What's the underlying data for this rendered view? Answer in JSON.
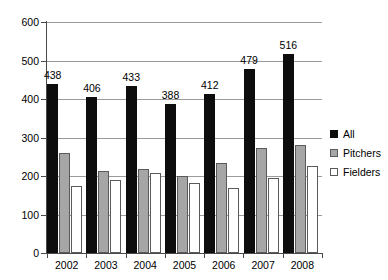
{
  "chart_data": {
    "type": "bar",
    "title": "",
    "subtitle": "",
    "xlabel": "",
    "ylabel": "",
    "categories": [
      "2002",
      "2003",
      "2004",
      "2005",
      "2006",
      "2007",
      "2008"
    ],
    "series": [
      {
        "name": "All",
        "color": "#0d0d0d",
        "values": [
          438,
          406,
          433,
          388,
          412,
          479,
          516
        ],
        "labels": [
          "438",
          "406",
          "433",
          "388",
          "412",
          "479",
          "516"
        ],
        "show_labels": true
      },
      {
        "name": "Pitchers",
        "color": "#a6a6a6",
        "values": [
          261,
          212,
          218,
          199,
          233,
          272,
          281
        ],
        "show_labels": false
      },
      {
        "name": "Fielders",
        "color": "#ffffff",
        "values": [
          173,
          190,
          209,
          183,
          169,
          196,
          225
        ],
        "show_labels": false
      }
    ],
    "ylim": [
      0,
      600
    ],
    "yticks": [
      0,
      100,
      200,
      300,
      400,
      500,
      600
    ],
    "ytick_labels": [
      "0",
      "100",
      "200",
      "300",
      "400",
      "500",
      "600"
    ],
    "grid": true,
    "grid_axis": "y",
    "legend_position": "right"
  },
  "legend": {
    "items": [
      {
        "label": "All"
      },
      {
        "label": "Pitchers"
      },
      {
        "label": "Fielders"
      }
    ]
  }
}
